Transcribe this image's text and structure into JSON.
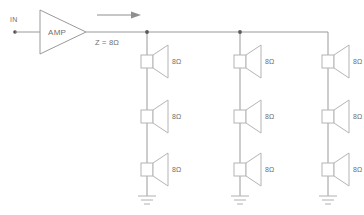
{
  "diagram": {
    "colors": {
      "wire": "#9a9a9a",
      "symbol": "#b4b4b4",
      "text": "#6f6f6f",
      "node": "#5a5a5a",
      "background": "#ffffff"
    },
    "input": {
      "label": "IN",
      "terminal_name": "input-terminal"
    },
    "amplifier": {
      "label": "AMP"
    },
    "output": {
      "impedance_label": "Z = 8Ω",
      "signal_arrow": "right-arrow"
    },
    "ground": {
      "label": "",
      "count": 3
    },
    "speakers": {
      "impedance_label": "8Ω",
      "rows": 3,
      "columns": 3,
      "items": [
        {
          "id": "spk-r1c1",
          "label": "8Ω",
          "row": 1,
          "col": 1
        },
        {
          "id": "spk-r1c2",
          "label": "8Ω",
          "row": 1,
          "col": 2
        },
        {
          "id": "spk-r1c3",
          "label": "8Ω",
          "row": 1,
          "col": 3
        },
        {
          "id": "spk-r2c1",
          "label": "8Ω",
          "row": 2,
          "col": 1
        },
        {
          "id": "spk-r2c2",
          "label": "8Ω",
          "row": 2,
          "col": 2
        },
        {
          "id": "spk-r2c3",
          "label": "8Ω",
          "row": 2,
          "col": 3
        },
        {
          "id": "spk-r3c1",
          "label": "8Ω",
          "row": 3,
          "col": 1
        },
        {
          "id": "spk-r3c2",
          "label": "8Ω",
          "row": 3,
          "col": 2
        },
        {
          "id": "spk-r3c3",
          "label": "8Ω",
          "row": 3,
          "col": 3
        }
      ]
    }
  }
}
